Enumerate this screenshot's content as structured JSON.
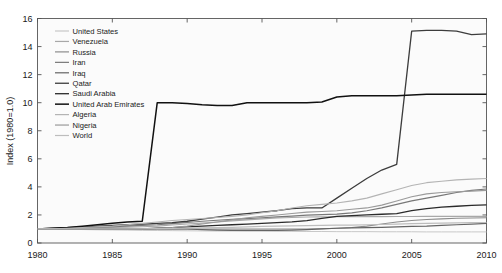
{
  "chart_data": {
    "type": "line",
    "title": "",
    "xlabel": "",
    "ylabel": "Index (1980=1.0)",
    "xlim": [
      1980,
      2010
    ],
    "ylim": [
      0,
      16
    ],
    "xticks": [
      1980,
      1985,
      1990,
      1995,
      2000,
      2005,
      2010
    ],
    "yticks": [
      0,
      2,
      4,
      6,
      8,
      10,
      12,
      14,
      16
    ],
    "grid": false,
    "legend_position": "upper-left-inside",
    "x": [
      1980,
      1981,
      1982,
      1983,
      1984,
      1985,
      1986,
      1987,
      1988,
      1989,
      1990,
      1991,
      1992,
      1993,
      1994,
      1995,
      1996,
      1997,
      1998,
      1999,
      2000,
      2001,
      2002,
      2003,
      2004,
      2005,
      2006,
      2007,
      2008,
      2009,
      2010
    ],
    "series": [
      {
        "name": "United States",
        "color": "#c8c8c8",
        "width": 1.0,
        "values": [
          1.0,
          1.0,
          0.98,
          0.96,
          0.94,
          0.93,
          0.92,
          0.9,
          0.89,
          0.88,
          0.87,
          0.86,
          0.85,
          0.85,
          0.84,
          0.84,
          0.83,
          0.83,
          0.82,
          0.82,
          0.81,
          0.81,
          0.81,
          0.8,
          0.8,
          0.8,
          0.79,
          0.79,
          0.79,
          0.79,
          0.79
        ]
      },
      {
        "name": "Venezuela",
        "color": "#a8a8a8",
        "width": 1.1,
        "values": [
          1.0,
          1.02,
          1.04,
          1.06,
          1.08,
          1.1,
          1.12,
          1.16,
          1.2,
          1.28,
          1.35,
          1.42,
          1.5,
          1.58,
          1.65,
          1.72,
          1.78,
          1.82,
          1.85,
          1.86,
          1.87,
          1.88,
          1.88,
          1.88,
          1.89,
          1.89,
          1.9,
          1.9,
          1.9,
          1.9,
          1.9
        ]
      },
      {
        "name": "Russia",
        "color": "#8c8c8c",
        "width": 1.1,
        "values": [
          1.0,
          1.0,
          1.0,
          1.0,
          1.0,
          1.0,
          1.0,
          1.0,
          1.0,
          1.0,
          1.0,
          1.0,
          1.0,
          1.0,
          1.0,
          1.0,
          1.0,
          1.0,
          1.0,
          1.02,
          1.05,
          1.1,
          1.2,
          1.35,
          1.5,
          1.6,
          1.68,
          1.72,
          1.76,
          1.78,
          1.8
        ]
      },
      {
        "name": "Iran",
        "color": "#787878",
        "width": 1.2,
        "values": [
          1.0,
          1.02,
          1.05,
          1.08,
          1.12,
          1.16,
          1.2,
          1.25,
          1.3,
          1.38,
          1.46,
          1.55,
          1.62,
          1.68,
          1.74,
          1.8,
          1.86,
          1.92,
          1.98,
          2.02,
          2.06,
          2.15,
          2.3,
          2.5,
          2.75,
          3.0,
          3.2,
          3.4,
          3.6,
          3.75,
          3.85
        ]
      },
      {
        "name": "Iraq",
        "color": "#646464",
        "width": 1.2,
        "values": [
          1.0,
          1.0,
          1.0,
          1.0,
          1.0,
          1.0,
          1.0,
          1.0,
          1.0,
          1.0,
          1.0,
          0.95,
          0.92,
          0.9,
          0.9,
          0.9,
          0.9,
          0.92,
          0.95,
          1.0,
          1.05,
          1.08,
          1.1,
          1.12,
          1.15,
          1.18,
          1.2,
          1.25,
          1.3,
          1.35,
          1.4
        ]
      },
      {
        "name": "Qatar",
        "color": "#3c3c3c",
        "width": 1.3,
        "values": [
          1.0,
          1.05,
          1.1,
          1.15,
          1.2,
          1.25,
          1.3,
          1.35,
          1.4,
          1.45,
          1.55,
          1.7,
          1.85,
          2.0,
          2.1,
          2.2,
          2.3,
          2.45,
          2.5,
          2.5,
          3.2,
          3.9,
          4.6,
          5.2,
          5.6,
          15.1,
          15.15,
          15.15,
          15.1,
          14.85,
          14.9
        ]
      },
      {
        "name": "Saudi Arabia",
        "color": "#2a2a2a",
        "width": 1.3,
        "values": [
          1.0,
          1.0,
          1.0,
          1.0,
          1.0,
          1.0,
          1.0,
          1.0,
          1.05,
          1.1,
          1.15,
          1.2,
          1.25,
          1.3,
          1.35,
          1.4,
          1.45,
          1.5,
          1.6,
          1.75,
          1.9,
          1.95,
          2.0,
          2.05,
          2.1,
          2.3,
          2.45,
          2.55,
          2.62,
          2.68,
          2.72
        ]
      },
      {
        "name": "United Arab Emirates",
        "color": "#111111",
        "width": 1.5,
        "values": [
          1.0,
          1.05,
          1.1,
          1.2,
          1.3,
          1.4,
          1.5,
          1.55,
          10.0,
          10.0,
          9.95,
          9.85,
          9.8,
          9.8,
          10.0,
          10.0,
          10.0,
          10.0,
          10.0,
          10.05,
          10.4,
          10.5,
          10.5,
          10.5,
          10.5,
          10.55,
          10.6,
          10.6,
          10.6,
          10.6,
          10.6
        ]
      },
      {
        "name": "Algeria",
        "color": "#b4b4b4",
        "width": 1.1,
        "values": [
          1.0,
          1.02,
          1.05,
          1.1,
          1.15,
          1.2,
          1.3,
          1.4,
          1.5,
          1.6,
          1.68,
          1.75,
          1.82,
          1.9,
          2.0,
          2.15,
          2.3,
          2.5,
          2.65,
          2.75,
          2.85,
          3.0,
          3.2,
          3.5,
          3.8,
          4.1,
          4.3,
          4.4,
          4.5,
          4.55,
          4.6
        ]
      },
      {
        "name": "Nigeria",
        "color": "#9a9a9a",
        "width": 1.1,
        "values": [
          1.0,
          1.0,
          1.0,
          1.0,
          1.0,
          1.0,
          1.0,
          1.02,
          1.05,
          1.1,
          1.2,
          1.35,
          1.5,
          1.65,
          1.8,
          1.9,
          2.0,
          2.1,
          2.2,
          2.25,
          2.3,
          2.4,
          2.5,
          2.7,
          3.0,
          3.3,
          3.5,
          3.6,
          3.65,
          3.7,
          3.75
        ]
      },
      {
        "name": "World",
        "color": "#bdbdbd",
        "width": 1.2,
        "values": [
          1.0,
          1.0,
          1.0,
          1.0,
          1.0,
          1.0,
          1.0,
          1.01,
          1.02,
          1.04,
          1.06,
          1.08,
          1.1,
          1.12,
          1.15,
          1.18,
          1.2,
          1.22,
          1.24,
          1.25,
          1.27,
          1.28,
          1.3,
          1.32,
          1.35,
          1.38,
          1.4,
          1.42,
          1.44,
          1.45,
          1.46
        ]
      }
    ]
  },
  "axes": {
    "ylabel": "Index (1980=1.0)",
    "ytick_labels": [
      "0",
      "2",
      "4",
      "6",
      "8",
      "10",
      "12",
      "14",
      "16"
    ],
    "xtick_labels": [
      "1980",
      "1985",
      "1990",
      "1995",
      "2000",
      "2005",
      "2010"
    ]
  },
  "legend": {
    "entries": [
      "United States",
      "Venezuela",
      "Russia",
      "Iran",
      "Iraq",
      "Qatar",
      "Saudi Arabia",
      "United Arab Emirates",
      "Algeria",
      "Nigeria",
      "World"
    ]
  },
  "colors": {
    "background": "#ffffff",
    "plot_background": "#fbfbfb",
    "frame": "#555555",
    "text": "#1a1a1a"
  }
}
